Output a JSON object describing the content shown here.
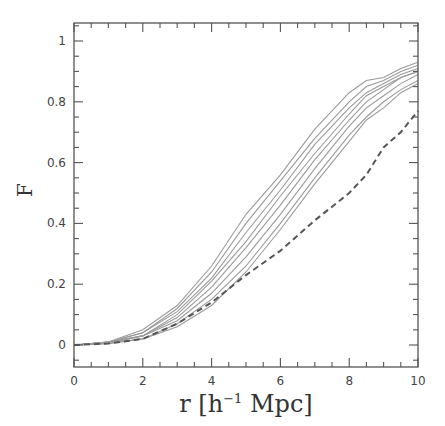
{
  "chart_data": {
    "type": "line",
    "title": "",
    "xlabel": "r [h⁻¹ Mpc]",
    "xlabel_parts": {
      "main": "r [h",
      "sup": "−1",
      "rest": " Mpc]"
    },
    "ylabel": "F",
    "xlim": [
      0,
      10
    ],
    "ylim": [
      -0.05,
      1.05
    ],
    "xticks": [
      0,
      2,
      4,
      6,
      8,
      10
    ],
    "xtick_labels": [
      "0",
      "2",
      "4",
      "6",
      "8",
      "10"
    ],
    "yticks": [
      0,
      0.2,
      0.4,
      0.6,
      0.8,
      1
    ],
    "ytick_labels": [
      "0",
      "0.2",
      "0.4",
      "0.6",
      "0.8",
      "1"
    ],
    "x_minor_step": 0.5,
    "y_minor_step": 0.05,
    "grid": false,
    "legend": null,
    "x": [
      0,
      1,
      2,
      3,
      4,
      5,
      6,
      7,
      8,
      8.5,
      9,
      9.5,
      10
    ],
    "series": [
      {
        "name": "solid-1",
        "style": "solid",
        "values": [
          0,
          0.01,
          0.05,
          0.13,
          0.26,
          0.43,
          0.56,
          0.71,
          0.83,
          0.87,
          0.88,
          0.91,
          0.93
        ]
      },
      {
        "name": "solid-2",
        "style": "solid",
        "values": [
          0,
          0.01,
          0.04,
          0.12,
          0.24,
          0.4,
          0.54,
          0.68,
          0.8,
          0.85,
          0.87,
          0.9,
          0.92
        ]
      },
      {
        "name": "solid-3",
        "style": "solid",
        "values": [
          0,
          0.01,
          0.04,
          0.11,
          0.22,
          0.37,
          0.51,
          0.66,
          0.78,
          0.83,
          0.86,
          0.89,
          0.91
        ]
      },
      {
        "name": "solid-4",
        "style": "solid",
        "values": [
          0,
          0.01,
          0.03,
          0.1,
          0.21,
          0.34,
          0.49,
          0.63,
          0.76,
          0.82,
          0.85,
          0.88,
          0.9
        ]
      },
      {
        "name": "solid-5",
        "style": "solid",
        "values": [
          0,
          0.01,
          0.03,
          0.09,
          0.19,
          0.32,
          0.46,
          0.61,
          0.74,
          0.8,
          0.84,
          0.88,
          0.9
        ]
      },
      {
        "name": "solid-6",
        "style": "solid",
        "values": [
          0,
          0.005,
          0.03,
          0.08,
          0.17,
          0.29,
          0.43,
          0.58,
          0.72,
          0.78,
          0.82,
          0.86,
          0.89
        ]
      },
      {
        "name": "solid-7",
        "style": "solid",
        "values": [
          0,
          0.005,
          0.02,
          0.07,
          0.15,
          0.26,
          0.4,
          0.55,
          0.69,
          0.75,
          0.8,
          0.84,
          0.87
        ]
      },
      {
        "name": "solid-8",
        "style": "solid",
        "values": [
          0,
          0.005,
          0.02,
          0.06,
          0.13,
          0.24,
          0.38,
          0.53,
          0.67,
          0.74,
          0.78,
          0.83,
          0.86
        ]
      },
      {
        "name": "dashed",
        "style": "dashed",
        "values": [
          0,
          0.005,
          0.02,
          0.07,
          0.14,
          0.23,
          0.31,
          0.41,
          0.5,
          0.56,
          0.65,
          0.7,
          0.77
        ]
      }
    ]
  }
}
